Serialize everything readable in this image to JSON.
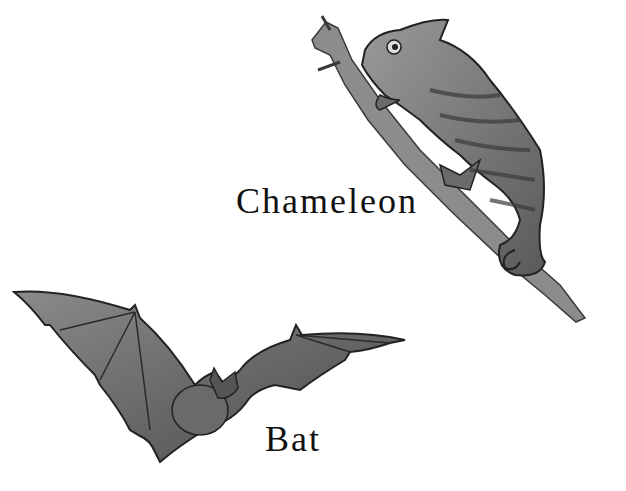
{
  "illustration": {
    "background_color": "#ffffff",
    "figures": [
      {
        "name": "chameleon",
        "label": "Chameleon",
        "description": "grayscale drawing of a chameleon climbing a diagonal branch"
      },
      {
        "name": "bat",
        "label": "Bat",
        "description": "grayscale drawing of a bat in flight with wings spread"
      }
    ]
  }
}
